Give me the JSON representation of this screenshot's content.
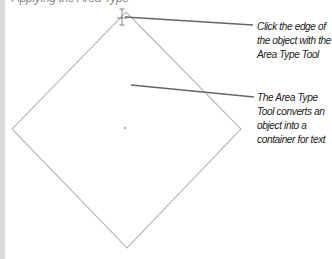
{
  "header": {
    "clipped_text": "Applying the Area Type"
  },
  "figure": {
    "shape": "diamond",
    "stroke_color": "#b8b8b8",
    "points": {
      "top": [
        126,
        12
      ],
      "right": [
        241,
        129
      ],
      "bottom": [
        127,
        248
      ],
      "left": [
        12,
        129
      ]
    },
    "center_marker": [
      125,
      128
    ],
    "cursor": "area-type-cursor"
  },
  "callouts": [
    {
      "lines": [
        "Click the edge of",
        "the object with the",
        "Area Type Tool"
      ]
    },
    {
      "lines": [
        "The Area Type",
        "Tool converts an",
        "object into a",
        "container for text"
      ]
    }
  ],
  "colors": {
    "leader_line": "#666666",
    "text": "#222222",
    "side_bar": "#dcdcdc"
  }
}
